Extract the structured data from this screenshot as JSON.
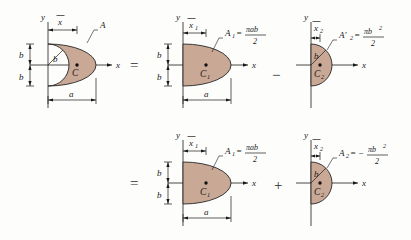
{
  "figure": {
    "fill_color": "#c9a895",
    "line_color": "#1a1a1a"
  },
  "operators": {
    "equals": "=",
    "minus": "−",
    "plus": "+"
  },
  "axis": {
    "x": "x",
    "y": "y"
  },
  "row1": {
    "shape1": {
      "name": "crescent",
      "area_label": "A",
      "centroid_label": "C",
      "xbar_label": "x",
      "xbar_overbar": true,
      "dim_b_upper": "b",
      "dim_b_lower": "b",
      "radius_label": "b",
      "dim_a": "a"
    },
    "shape2": {
      "name": "semi-ellipse",
      "area_symbol": "A",
      "area_subscript": "1",
      "area_equals": "=",
      "area_numerator": "πab",
      "area_denominator": "2",
      "centroid_label": "C",
      "centroid_subscript": "1",
      "xbar_label": "x",
      "xbar_subscript": "1",
      "dim_b_upper": "b",
      "dim_b_lower": "b",
      "dim_a": "a"
    },
    "shape3": {
      "name": "semicircle-subtracted",
      "area_symbol": "A′",
      "area_subscript": "2",
      "area_equals": "=",
      "area_numerator": "πb",
      "area_numerator_exponent": "2",
      "area_denominator": "2",
      "centroid_label": "C",
      "centroid_subscript": "2",
      "xbar_label": "x",
      "xbar_subscript": "2",
      "radius_label": "b"
    }
  },
  "row2": {
    "shape1": {
      "name": "semi-ellipse",
      "area_symbol": "A",
      "area_subscript": "1",
      "area_equals": "=",
      "area_numerator": "πab",
      "area_denominator": "2",
      "centroid_label": "C",
      "centroid_subscript": "1",
      "xbar_label": "x",
      "xbar_subscript": "1",
      "dim_b_upper": "b",
      "dim_b_lower": "b",
      "dim_a": "a"
    },
    "shape2": {
      "name": "semicircle-negative-area",
      "area_symbol": "A",
      "area_subscript": "2",
      "area_equals": "=",
      "area_sign": "−",
      "area_numerator": "πb",
      "area_numerator_exponent": "2",
      "area_denominator": "2",
      "centroid_label": "C",
      "centroid_subscript": "2",
      "xbar_label": "x",
      "xbar_subscript": "2",
      "radius_label": "b"
    }
  }
}
